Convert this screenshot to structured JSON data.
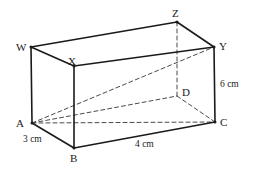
{
  "figure": {
    "name": "cuboid-diagram",
    "background_color": "#ffffff",
    "line_color": "#1a1a1a",
    "dashed_line_color": "#4a4a4a",
    "solid_stroke_width": 1.6,
    "dashed_stroke_width": 1.0,
    "dash_pattern": "4,3"
  },
  "vertices": [
    {
      "id": "W",
      "label": "W",
      "x": 31,
      "y": 47,
      "label_x": 16,
      "label_y": 42,
      "hidden": false
    },
    {
      "id": "X",
      "label": "X",
      "x": 74,
      "y": 66,
      "label_x": 68,
      "label_y": 56,
      "hidden": false
    },
    {
      "id": "Z",
      "label": "Z",
      "x": 177,
      "y": 22,
      "label_x": 172,
      "label_y": 8,
      "hidden": false
    },
    {
      "id": "Y",
      "label": "Y",
      "x": 214,
      "y": 47,
      "label_x": 219,
      "label_y": 41,
      "hidden": false
    },
    {
      "id": "A",
      "label": "A",
      "x": 32,
      "y": 123,
      "label_x": 16,
      "label_y": 118,
      "hidden": false
    },
    {
      "id": "B",
      "label": "B",
      "x": 74,
      "y": 148,
      "label_x": 70,
      "label_y": 153,
      "hidden": false
    },
    {
      "id": "D",
      "label": "D",
      "x": 177,
      "y": 96,
      "label_x": 182,
      "label_y": 87,
      "hidden": true
    },
    {
      "id": "C",
      "label": "C",
      "x": 215,
      "y": 122,
      "label_x": 220,
      "label_y": 117,
      "hidden": false
    }
  ],
  "edges": {
    "solid": [
      {
        "name": "edge-W-X",
        "from": "W",
        "to": "X"
      },
      {
        "name": "edge-W-Z",
        "from": "W",
        "to": "Z"
      },
      {
        "name": "edge-Z-Y",
        "from": "Z",
        "to": "Y"
      },
      {
        "name": "edge-X-Y",
        "from": "X",
        "to": "Y"
      },
      {
        "name": "edge-W-A",
        "from": "W",
        "to": "A"
      },
      {
        "name": "edge-X-B",
        "from": "X",
        "to": "B"
      },
      {
        "name": "edge-Y-C",
        "from": "Y",
        "to": "C"
      },
      {
        "name": "edge-A-B",
        "from": "A",
        "to": "B"
      },
      {
        "name": "edge-B-C",
        "from": "B",
        "to": "C"
      }
    ],
    "dashed": [
      {
        "name": "edge-A-C",
        "from": "A",
        "to": "C"
      },
      {
        "name": "edge-A-D",
        "from": "A",
        "to": "D"
      },
      {
        "name": "edge-D-C",
        "from": "D",
        "to": "C"
      },
      {
        "name": "edge-Z-D",
        "from": "Z",
        "to": "D"
      },
      {
        "name": "diagonal-A-Y",
        "from": "A",
        "to": "Y"
      }
    ]
  },
  "dimensions": [
    {
      "id": "depth",
      "label": "3 cm",
      "x": 23,
      "y": 135,
      "edge": "A-B"
    },
    {
      "id": "length",
      "label": "4 cm",
      "x": 135,
      "y": 140,
      "edge": "B-C"
    },
    {
      "id": "height",
      "label": "6 cm",
      "x": 220,
      "y": 80,
      "edge": "Y-C"
    }
  ]
}
